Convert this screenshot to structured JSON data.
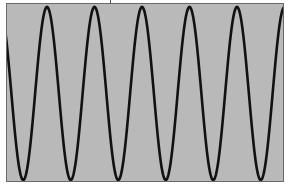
{
  "figure": {
    "kind": "sinusoidal waveform trace",
    "background_color": "#b9b9b9",
    "trace_color": "#111111",
    "frame_color": "#6a6a6a"
  },
  "waveform": {
    "type": "sine",
    "period_px": 47.5,
    "amplitude_px": 86.5,
    "center_y_px": 93.5,
    "peaks_x_px": [
      47,
      95,
      143,
      190,
      238
    ],
    "troughs_x_px": [
      25,
      72,
      120,
      167,
      215,
      262
    ],
    "cycles_visible": 5.8
  }
}
